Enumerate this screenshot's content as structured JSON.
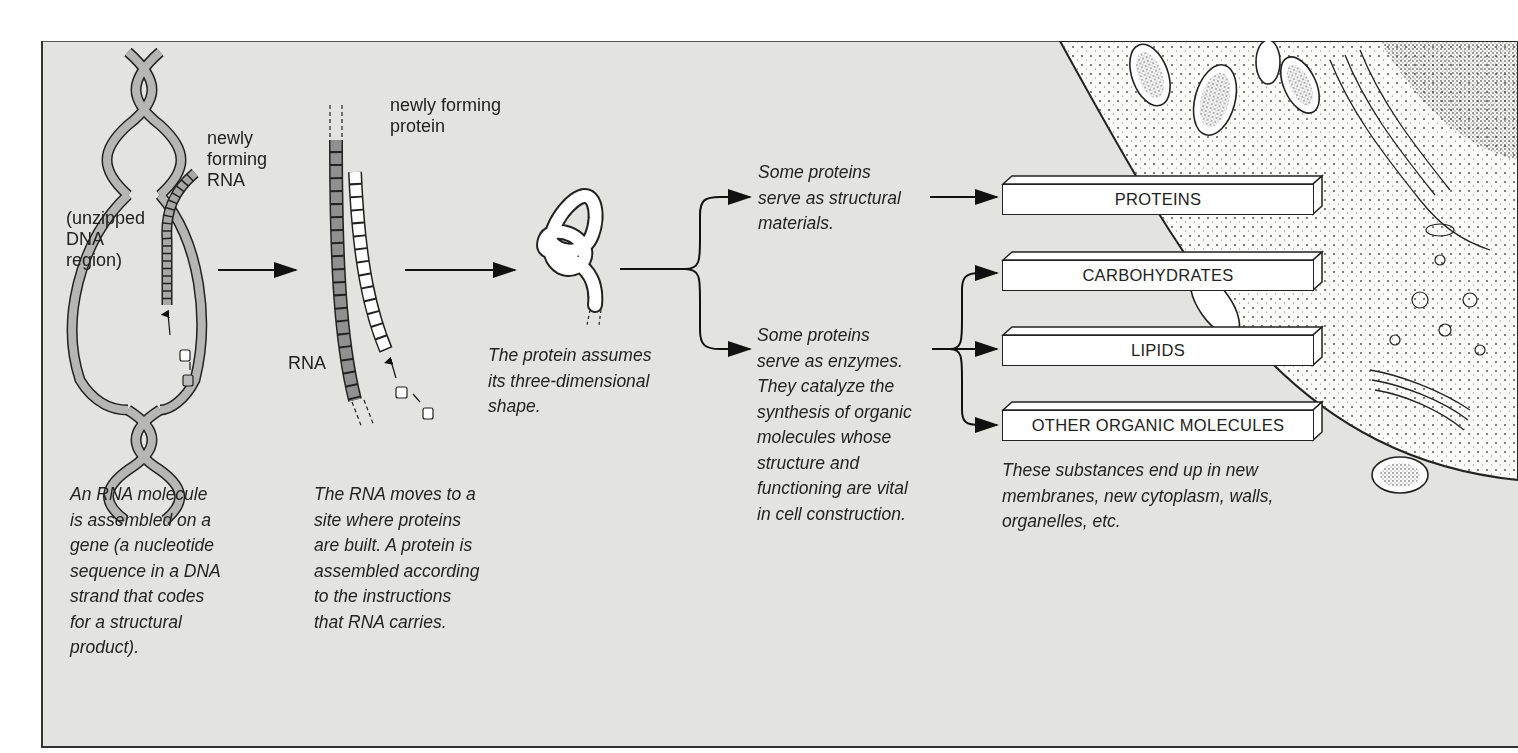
{
  "colors": {
    "background": "#e3e3e1",
    "dna_strand": "#b6b6b4",
    "rna_strand": "#9a9a98",
    "protein_strand": "#ffffff",
    "outline": "#222222"
  },
  "labels": {
    "newly_forming_rna": "newly\nforming\nRNA",
    "unzipped_dna": "(unzipped\nDNA\nregion)",
    "rna": "RNA",
    "newly_forming_protein": "newly forming\nprotein"
  },
  "captions": {
    "rna_assembly": "An RNA molecule\nis assembled on a\ngene (a nucleotide\nsequence in a DNA\nstrand that codes\nfor a  structural\nproduct).",
    "rna_moves": "The RNA moves to a\nsite where proteins\nare built. A protein is\nassembled according\nto the instructions\nthat RNA carries.",
    "protein_shape": "The protein assumes\nits three-dimensional\nshape.",
    "structural": "Some proteins\nserve as structural\nmaterials.",
    "enzymes": "Some proteins\nserve as enzymes.\nThey catalyze the\nsynthesis of organic\nmolecules whose\nstructure and\nfunctioning are vital\nin cell construction.",
    "substances": "These substances end up in new\nmembranes, new cytoplasm, walls,\norganelles, etc."
  },
  "boxes": [
    {
      "label": "PROTEINS"
    },
    {
      "label": "CARBOHYDRATES"
    },
    {
      "label": "LIPIDS"
    },
    {
      "label": "OTHER ORGANIC MOLECULES"
    }
  ]
}
